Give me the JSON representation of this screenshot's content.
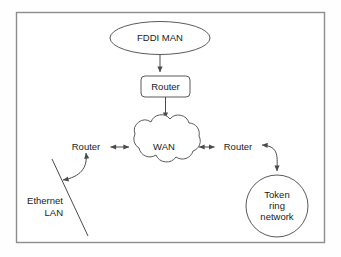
{
  "diagram": {
    "frame": {
      "border_color": "#8d8d8d",
      "background": "#ffffff"
    },
    "line_color": "#4a4a4a",
    "nodes": {
      "fddi": {
        "label": "FDDI MAN",
        "shape": "ellipse"
      },
      "router_top": {
        "label": "Router",
        "shape": "rounded-rect"
      },
      "wan": {
        "label": "WAN",
        "shape": "cloud"
      },
      "router_left": {
        "label": "Router",
        "shape": "text"
      },
      "router_right": {
        "label": "Router",
        "shape": "text"
      },
      "ethernet": {
        "label_line1": "Ethernet",
        "label_line2": "LAN",
        "shape": "bus-line"
      },
      "token_ring": {
        "label_line1": "Token",
        "label_line2": "ring",
        "label_line3": "network",
        "shape": "circle"
      }
    },
    "connections": [
      {
        "from": "fddi",
        "to": "router_top",
        "style": "arrow-down"
      },
      {
        "from": "router_top",
        "to": "wan",
        "style": "arrow-down"
      },
      {
        "from": "router_left",
        "to": "wan",
        "style": "double-arrow"
      },
      {
        "from": "wan",
        "to": "router_right",
        "style": "double-arrow"
      },
      {
        "from": "router_left",
        "to": "ethernet",
        "style": "curved-double-arrow"
      },
      {
        "from": "router_right",
        "to": "token_ring",
        "style": "curved-double-arrow"
      }
    ]
  }
}
